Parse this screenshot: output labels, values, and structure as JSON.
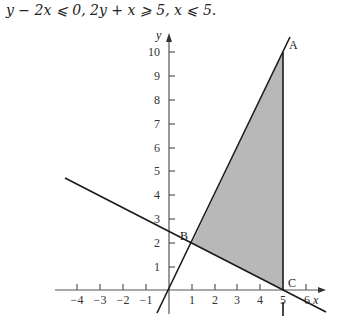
{
  "caption": "y − 2x ⩽ 0, 2y + x ⩾ 5, x ⩽ 5.",
  "axes": {
    "x_label": "x",
    "y_label": "y",
    "x_ticks": [
      "−4",
      "−3",
      "−2",
      "−1",
      "1",
      "2",
      "3",
      "4",
      "5",
      "6"
    ],
    "y_ticks": [
      "1",
      "2",
      "3",
      "4",
      "5",
      "6",
      "7",
      "8",
      "9",
      "10"
    ]
  },
  "points": {
    "A": {
      "label": "A",
      "x": 5,
      "y": 10
    },
    "B": {
      "label": "B",
      "x": 1,
      "y": 2
    },
    "C": {
      "label": "C",
      "x": 5,
      "y": 0
    }
  },
  "lines": [
    {
      "name": "y = 2x"
    },
    {
      "name": "2y + x = 5"
    },
    {
      "name": "x = 5"
    }
  ],
  "colors": {
    "shade": "#b8b8b8",
    "line": "#1a1a1a",
    "axis": "#555555"
  }
}
